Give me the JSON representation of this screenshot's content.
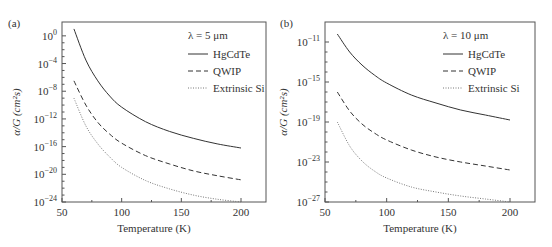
{
  "chart_data": [
    {
      "panel": "(a)",
      "type": "line",
      "title": "λ = 5 μm",
      "xlabel": "Temperature (K)",
      "ylabel": "α/G (cm²s)",
      "xlim": [
        50,
        210
      ],
      "ylim_log10": [
        -24,
        2
      ],
      "x_ticks": [
        "50",
        "100",
        "150",
        "200"
      ],
      "y_ticks": [
        "10^0",
        "10^-4",
        "10^-8",
        "10^-12",
        "10^-16",
        "10^-20",
        "10^-24"
      ],
      "y_tick_exps": [
        "0",
        "−4",
        "−8",
        "−12",
        "−16",
        "−20",
        "−24"
      ],
      "grid": false,
      "legend_position": "upper right",
      "x": [
        60,
        70,
        80,
        90,
        100,
        120,
        140,
        160,
        180,
        200
      ],
      "series": [
        {
          "name": "HgCdTe",
          "style": "solid",
          "log10_values": [
            1.0,
            -3.5,
            -6.5,
            -8.7,
            -10.3,
            -12.4,
            -13.8,
            -14.8,
            -15.6,
            -16.2
          ]
        },
        {
          "name": "QWIP",
          "style": "dashed",
          "log10_values": [
            -6.5,
            -10.0,
            -12.5,
            -14.2,
            -15.5,
            -17.3,
            -18.5,
            -19.5,
            -20.2,
            -20.8
          ]
        },
        {
          "name": "Extrinsic Si",
          "style": "dotted",
          "log10_values": [
            -9.0,
            -13.0,
            -15.6,
            -17.5,
            -19.0,
            -20.9,
            -22.1,
            -23.0,
            -23.6,
            -24.0
          ]
        }
      ]
    },
    {
      "panel": "(b)",
      "type": "line",
      "title": "λ = 10 μm",
      "xlabel": "Temperature (K)",
      "ylabel": "α/G (cm²s)",
      "xlim": [
        50,
        210
      ],
      "ylim_log10": [
        -27,
        -9
      ],
      "x_ticks": [
        "50",
        "100",
        "150",
        "200"
      ],
      "y_ticks": [
        "10^-11",
        "10^-15",
        "10^-19",
        "10^-23",
        "10^-27"
      ],
      "y_tick_exps": [
        "−11",
        "−15",
        "−19",
        "−23",
        "−27"
      ],
      "grid": false,
      "legend_position": "upper right",
      "x": [
        60,
        70,
        80,
        90,
        100,
        120,
        140,
        160,
        180,
        200
      ],
      "series": [
        {
          "name": "HgCdTe",
          "style": "solid",
          "log10_values": [
            -10.2,
            -12.0,
            -13.3,
            -14.3,
            -15.1,
            -16.3,
            -17.1,
            -17.8,
            -18.3,
            -18.8
          ]
        },
        {
          "name": "QWIP",
          "style": "dashed",
          "log10_values": [
            -16.0,
            -17.9,
            -19.2,
            -20.1,
            -20.8,
            -21.8,
            -22.5,
            -23.0,
            -23.4,
            -23.8
          ]
        },
        {
          "name": "Extrinsic Si",
          "style": "dotted",
          "log10_values": [
            -19.0,
            -21.4,
            -22.9,
            -23.9,
            -24.6,
            -25.5,
            -26.0,
            -26.4,
            -26.7,
            -27.0
          ]
        }
      ]
    }
  ]
}
